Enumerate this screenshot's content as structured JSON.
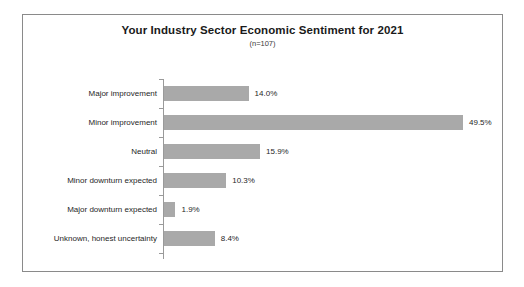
{
  "chart_data": {
    "type": "bar",
    "orientation": "horizontal",
    "title": "Your Industry Sector Economic Sentiment for 2021",
    "subtitle": "(n=107)",
    "xlabel": "",
    "ylabel": "",
    "xlim": [
      0,
      49.5
    ],
    "grid": false,
    "legend": false,
    "value_suffix": "%",
    "bar_color": "#a9a9a9",
    "axis_color": "#9a9a9a",
    "border_color": "#8a8a8a",
    "text_color": "#1f1f1f",
    "categories": [
      "Major improvement",
      "Minor improvement",
      "Neutral",
      "Minor downturn expected",
      "Major downturn expected",
      "Unknown, honest uncertainty"
    ],
    "values": [
      14.0,
      49.5,
      15.9,
      10.3,
      1.9,
      8.4
    ],
    "value_labels": [
      "14.0%",
      "49.5%",
      "15.9%",
      "10.3%",
      "1.9%",
      "8.4%"
    ]
  }
}
